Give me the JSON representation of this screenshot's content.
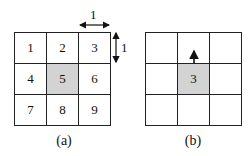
{
  "panels": [
    {
      "id": "a",
      "caption": "(a)",
      "cells": [
        "1",
        "2",
        "3",
        "4",
        "5",
        "6",
        "7",
        "8",
        "9"
      ],
      "highlighted_index": 4,
      "dimension_labels": {
        "horizontal": "1",
        "vertical": "1"
      }
    },
    {
      "id": "b",
      "caption": "(b)",
      "cells": [
        "",
        "",
        "",
        "",
        "3",
        "",
        "",
        "",
        ""
      ],
      "highlighted_index": 4,
      "arrow": "up"
    }
  ],
  "colors": {
    "highlight": "#d3d3d3",
    "line": "#222222"
  }
}
